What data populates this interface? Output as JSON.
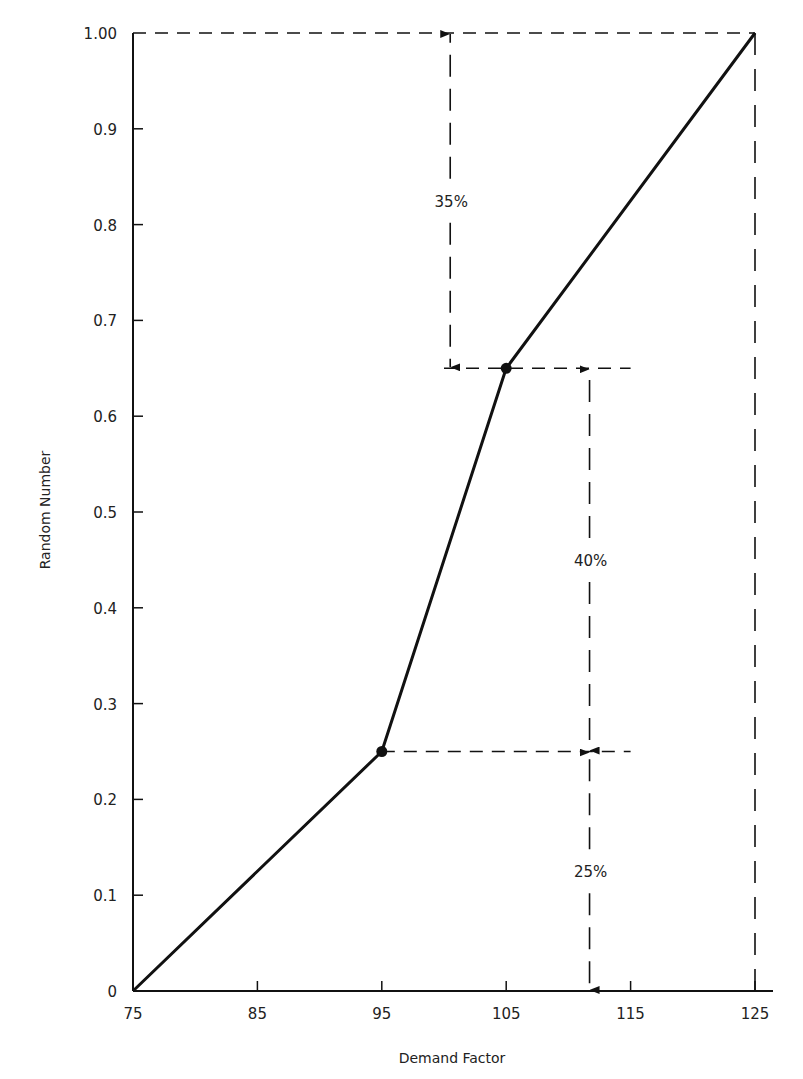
{
  "chart_data": {
    "type": "line",
    "title": "",
    "xlabel": "Demand Factor",
    "ylabel": "Random Number",
    "xlim": [
      75,
      125
    ],
    "ylim": [
      0,
      1.0
    ],
    "grid": false,
    "x_ticks": [
      75,
      85,
      95,
      105,
      115,
      125
    ],
    "x_tick_labels": [
      "75",
      "85",
      "95",
      "105",
      "115",
      "125"
    ],
    "y_ticks": [
      0,
      0.1,
      0.2,
      0.3,
      0.4,
      0.5,
      0.6,
      0.7,
      0.8,
      0.9,
      1.0
    ],
    "y_tick_labels": [
      "0",
      "0.1",
      "0.2",
      "0.3",
      "0.4",
      "0.5",
      "0.6",
      "0.7",
      "0.8",
      "0.9",
      "1.00"
    ],
    "series": [
      {
        "name": "Cumulative distribution",
        "x": [
          75,
          95,
          105,
          125
        ],
        "y": [
          0,
          0.25,
          0.65,
          1.0
        ],
        "markers_at": [
          1,
          2
        ]
      }
    ],
    "guides": {
      "horizontal_dashed": [
        {
          "y": 1.0,
          "x_from": 75,
          "x_to": 125
        },
        {
          "y": 0.65,
          "x_from": 100,
          "x_to": 115
        },
        {
          "y": 0.25,
          "x_from": 95,
          "x_to": 115
        }
      ],
      "vertical_dashed": [
        {
          "x": 125,
          "y_from": 0,
          "y_to": 1.0
        }
      ]
    },
    "annotations": [
      {
        "text": "35%",
        "x": 100.5,
        "y_from": 0.65,
        "y_to": 1.0
      },
      {
        "text": "40%",
        "x": 111.7,
        "y_from": 0.25,
        "y_to": 0.65
      },
      {
        "text": "25%",
        "x": 111.7,
        "y_from": 0,
        "y_to": 0.25
      }
    ]
  }
}
